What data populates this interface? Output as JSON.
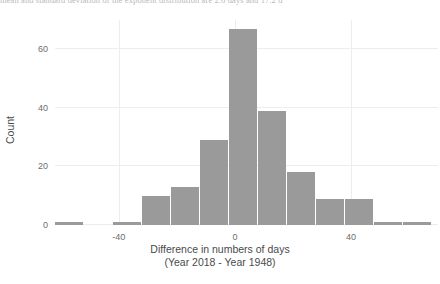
{
  "caption": {
    "text": "mean and standard deviation of the exponent distribution are 2.6 days and 17.2 d"
  },
  "chart_data": {
    "type": "bar",
    "title": "",
    "subtitle": "",
    "xlabel": "Difference in numbers of days",
    "xlabel_line2": "(Year 2018 - Year 1948)",
    "ylabel": "Count",
    "xlim": [
      -62,
      70
    ],
    "ylim": [
      0,
      70
    ],
    "xticks": [
      -40,
      0,
      40
    ],
    "xtick_labels": [
      "-40",
      "0",
      "40"
    ],
    "yticks": [
      0,
      20,
      40,
      60
    ],
    "ytick_labels": [
      "0",
      "20",
      "40",
      "60"
    ],
    "grid": true,
    "legend": "none",
    "bar_color": "#9a9a9a",
    "bin_width": 10,
    "bin_starts": [
      -62,
      -52,
      -42,
      -32,
      -22,
      -12,
      -2,
      8,
      18,
      28,
      38,
      48,
      58
    ],
    "bin_centers": [
      -57,
      -47,
      -37,
      -27,
      -17,
      -7,
      3,
      13,
      23,
      33,
      43,
      53,
      63
    ],
    "categories": [
      "-62 to -52",
      "-52 to -42",
      "-42 to -32",
      "-32 to -22",
      "-22 to -12",
      "-12 to -2",
      "-2 to 8",
      "8 to 18",
      "18 to 28",
      "28 to 38",
      "38 to 48",
      "48 to 58",
      "58 to 68"
    ],
    "values": [
      1,
      0,
      1,
      10,
      13,
      29,
      67,
      39,
      18,
      9,
      9,
      1,
      1
    ]
  }
}
